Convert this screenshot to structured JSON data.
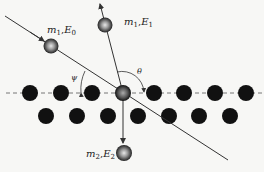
{
  "diagram": {
    "title": "",
    "colors": {
      "background": "#f7f7f5",
      "atom": "#111111",
      "line": "#333333",
      "dashed_line": "#777777",
      "particle": "#888888"
    },
    "labels": {
      "incident": {
        "symbol": "m",
        "sub1": "1",
        "sep": ",",
        "energy": "E",
        "sub2": "0"
      },
      "scattered": {
        "symbol": "m",
        "sub1": "1",
        "sep": ",",
        "energy": "E",
        "sub2": "1"
      },
      "recoil": {
        "symbol": "m",
        "sub1": "2",
        "sep": ",",
        "energy": "E",
        "sub2": "2"
      },
      "angle_psi": "ψ",
      "angle_theta": "θ"
    },
    "lattice": {
      "top_row_x": [
        30,
        61,
        92,
        123,
        154,
        184,
        215,
        246
      ],
      "top_row_y": 93,
      "bottom_row_x": [
        46,
        77,
        108,
        138,
        169,
        199,
        230
      ],
      "bottom_row_y": 116,
      "target_atom_index": 3
    }
  }
}
